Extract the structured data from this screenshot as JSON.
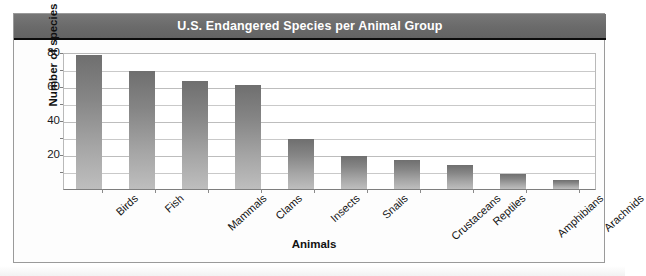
{
  "chart_data": {
    "type": "bar",
    "title": "U.S. Endangered Species per Animal Group",
    "xlabel": "Animals",
    "ylabel": "Number of species",
    "categories": [
      "Birds",
      "Fish",
      "Mammals",
      "Clams",
      "Insects",
      "Snails",
      "Crustaceans",
      "Reptiles",
      "Amphibians",
      "Arachnids"
    ],
    "values": [
      78,
      69,
      63,
      61,
      29,
      19,
      17,
      14,
      9,
      5
    ],
    "ylim": [
      0,
      80
    ],
    "ytick_labels": [
      "20",
      "40",
      "60",
      "80"
    ],
    "ytick_values": [
      20,
      40,
      60,
      80
    ],
    "minor_gridline_values": [
      10,
      30,
      50,
      70
    ],
    "grid": true,
    "legend": "none",
    "bar_color_top": "#6f6f6f",
    "bar_color_bottom": "#bebebe",
    "title_banner_color": "#6a6a6a",
    "title_text_color": "#ffffff"
  }
}
